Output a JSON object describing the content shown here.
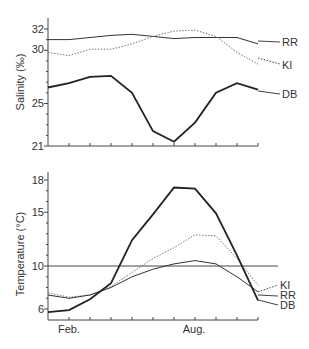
{
  "chart_data": [
    {
      "type": "line",
      "title": "",
      "ylabel": "Salinity (‰)",
      "xlabel": "",
      "ylim": [
        21,
        33
      ],
      "yticks": [
        21,
        25,
        30,
        32
      ],
      "x": [
        "Jan",
        "Feb",
        "Mar",
        "Apr",
        "May",
        "Jun",
        "Jul",
        "Aug",
        "Sep",
        "Oct",
        "Nov"
      ],
      "series": [
        {
          "name": "RR",
          "style": "thin-solid",
          "values": [
            31.0,
            31.0,
            31.2,
            31.4,
            31.5,
            31.3,
            31.1,
            31.2,
            31.2,
            31.2,
            30.6
          ]
        },
        {
          "name": "KI",
          "style": "dotted",
          "values": [
            29.8,
            29.5,
            30.1,
            30.1,
            30.6,
            31.3,
            31.8,
            31.9,
            31.3,
            29.8,
            28.7
          ]
        },
        {
          "name": "DB",
          "style": "thick-solid",
          "values": [
            26.5,
            26.9,
            27.5,
            27.6,
            26.0,
            22.4,
            21.4,
            23.2,
            26.0,
            26.9,
            26.3
          ]
        }
      ],
      "grid": false,
      "legend_position": "inline-right"
    },
    {
      "type": "line",
      "title": "",
      "ylabel": "Temperature (°C)",
      "xlabel": "",
      "ylim": [
        5,
        18.5
      ],
      "yticks": [
        6,
        10,
        15,
        18
      ],
      "xtick_labels": {
        "Feb.": 1,
        "Aug.": 7
      },
      "x": [
        "Jan",
        "Feb",
        "Mar",
        "Apr",
        "May",
        "Jun",
        "Jul",
        "Aug",
        "Sep",
        "Oct",
        "Nov"
      ],
      "series": [
        {
          "name": "KI",
          "style": "dotted",
          "values": [
            7.5,
            7.1,
            7.3,
            8.1,
            9.4,
            10.7,
            11.7,
            12.9,
            12.8,
            10.7,
            8.2
          ]
        },
        {
          "name": "RR",
          "style": "thin-solid",
          "values": [
            7.3,
            7.0,
            7.3,
            8.0,
            9.0,
            9.7,
            10.2,
            10.5,
            10.2,
            9.0,
            7.6
          ]
        },
        {
          "name": "DB",
          "style": "thick-solid",
          "values": [
            5.7,
            5.9,
            6.9,
            8.4,
            12.4,
            14.8,
            17.3,
            17.2,
            14.9,
            11.0,
            6.8
          ]
        }
      ],
      "reference_line": 10,
      "grid": false,
      "legend_position": "inline-right"
    }
  ],
  "labels": {
    "top_ylabel": "Salinity (‰)",
    "bottom_ylabel": "Temperature (°C)",
    "feb": "Feb.",
    "aug": "Aug.",
    "top": {
      "t32": "32",
      "t30": "30",
      "t25": "25",
      "t21": "21",
      "RR": "RR",
      "KI": "KI",
      "DB": "DB"
    },
    "bottom": {
      "t18": "18",
      "t15": "15",
      "t10": "10",
      "t6": "6",
      "KI": "KI",
      "RR": "RR",
      "DB": "DB"
    }
  }
}
